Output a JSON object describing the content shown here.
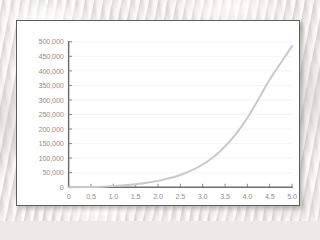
{
  "chart_data": {
    "type": "line",
    "title": "",
    "subtitle": "",
    "xlabel": "",
    "ylabel": "",
    "xlim": [
      0,
      5
    ],
    "ylim": [
      0,
      500000
    ],
    "grid": true,
    "legend": false,
    "legend_position": "none",
    "line_color": "#c9c9cb",
    "axis_color": "#6e6e70",
    "gridline_color": "#eef1f5",
    "tick_label_color": "#8e8e90",
    "x_tick_labels": [
      "0",
      "0.5",
      "1.0",
      "1.5",
      "2.0",
      "2.5",
      "3.0",
      "3.5",
      "4.0",
      "4.5",
      "5.0"
    ],
    "x_tick_values": [
      0,
      0.5,
      1.0,
      1.5,
      2.0,
      2.5,
      3.0,
      3.5,
      4.0,
      4.5,
      5.0
    ],
    "y_tick_labels": [
      "0",
      "50,000",
      "100,000",
      "150,000",
      "200,000",
      "250,000",
      "300,000",
      "350,000",
      "400,000",
      "450,000",
      "500,000"
    ],
    "y_tick_values": [
      0,
      50000,
      100000,
      150000,
      200000,
      250000,
      300000,
      350000,
      400000,
      450000,
      500000
    ],
    "series": [
      {
        "name": "series-1",
        "color": "#c9c9cb",
        "x": [
          0,
          0.25,
          0.5,
          0.75,
          1.0,
          1.25,
          1.5,
          1.75,
          2.0,
          2.25,
          2.5,
          2.75,
          3.0,
          3.25,
          3.5,
          3.75,
          4.0,
          4.25,
          4.5,
          4.75,
          5.0
        ],
        "values": [
          0,
          150,
          650,
          1800,
          3700,
          6500,
          10200,
          15200,
          21800,
          30500,
          42000,
          57500,
          78000,
          105000,
          140000,
          184000,
          238000,
          303000,
          370000,
          428000,
          485000
        ]
      }
    ]
  },
  "frame": {
    "border_color": "#5d5d5d",
    "background_color": "#ffffff"
  },
  "page": {
    "background_color": "#edebe8"
  }
}
